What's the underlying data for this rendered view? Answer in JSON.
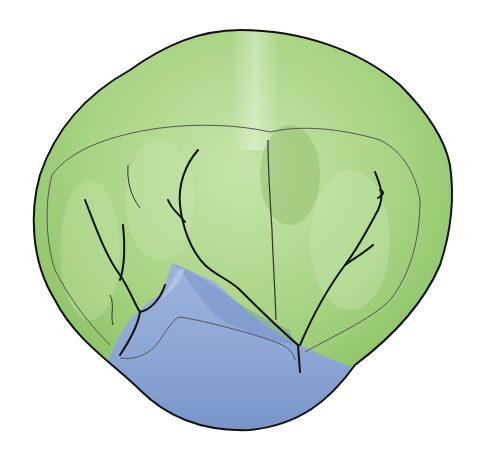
{
  "illustration": {
    "subject": "tooth-crown-occlusal-view",
    "colors": {
      "background": "#ffffff",
      "green_light": "#bfe0a2",
      "green_mid": "#9fd07a",
      "green_dark": "#7fb85a",
      "blue_light": "#a9bde0",
      "blue_mid": "#8aa5d4",
      "blue_dark": "#6f8ec6",
      "outline": "#111111",
      "fine_line": "#555555"
    }
  }
}
